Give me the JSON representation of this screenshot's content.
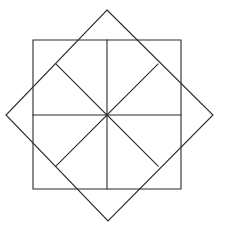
{
  "figure": {
    "background_color": "#ffffff",
    "stroke_color": "#2b2b2b",
    "stroke_width": 1.1,
    "canvas": {
      "width": 225,
      "height": 237
    }
  },
  "shapes": {
    "outer_square": {
      "name": "axis-aligned square",
      "left": 33,
      "top": 40,
      "right": 181,
      "bottom": 189,
      "width": 148,
      "height": 149,
      "points": "33,40 181,40 181,189 33,189"
    },
    "rotated_square": {
      "name": "diamond (square rotated 45 degrees)",
      "points": "107,10 213,115 108,221 6,115",
      "vertices": {
        "top": {
          "x": 107,
          "y": 10
        },
        "right": {
          "x": 213,
          "y": 115
        },
        "bottom": {
          "x": 108,
          "y": 221
        },
        "left": {
          "x": 6,
          "y": 115
        }
      }
    }
  },
  "center": {
    "x": 107,
    "y": 115,
    "label": "center point"
  },
  "radial_lines": [
    {
      "name": "spoke-north",
      "x1": 107,
      "y1": 115,
      "x2": 107,
      "y2": 40
    },
    {
      "name": "spoke-northeast",
      "x1": 107,
      "y1": 115,
      "x2": 158,
      "y2": 64
    },
    {
      "name": "spoke-east",
      "x1": 107,
      "y1": 115,
      "x2": 181,
      "y2": 115
    },
    {
      "name": "spoke-southeast",
      "x1": 107,
      "y1": 115,
      "x2": 158,
      "y2": 166
    },
    {
      "name": "spoke-south",
      "x1": 107,
      "y1": 115,
      "x2": 107,
      "y2": 189
    },
    {
      "name": "spoke-southwest",
      "x1": 107,
      "y1": 115,
      "x2": 56,
      "y2": 166
    },
    {
      "name": "spoke-west",
      "x1": 107,
      "y1": 115,
      "x2": 33,
      "y2": 115
    },
    {
      "name": "spoke-northwest",
      "x1": 107,
      "y1": 115,
      "x2": 56,
      "y2": 64
    }
  ],
  "chart_data": {
    "type": "diagram",
    "elements": [
      {
        "kind": "polygon",
        "name": "outer-square",
        "vertices": [
          [
            33,
            40
          ],
          [
            181,
            40
          ],
          [
            181,
            189
          ],
          [
            33,
            189
          ]
        ]
      },
      {
        "kind": "polygon",
        "name": "rotated-square",
        "vertices": [
          [
            107,
            10
          ],
          [
            213,
            115
          ],
          [
            108,
            221
          ],
          [
            6,
            115
          ]
        ]
      },
      {
        "kind": "segment",
        "name": "vertical-axis",
        "from": [
          107,
          40
        ],
        "to": [
          107,
          189
        ]
      },
      {
        "kind": "segment",
        "name": "horizontal-axis",
        "from": [
          33,
          115
        ],
        "to": [
          181,
          115
        ]
      },
      {
        "kind": "segment",
        "name": "diagonal-nw-se",
        "from": [
          56,
          64
        ],
        "to": [
          158,
          166
        ]
      },
      {
        "kind": "segment",
        "name": "diagonal-ne-sw",
        "from": [
          158,
          64
        ],
        "to": [
          56,
          166
        ]
      }
    ],
    "symmetry": "8-fold dihedral about center (107, 115)"
  }
}
